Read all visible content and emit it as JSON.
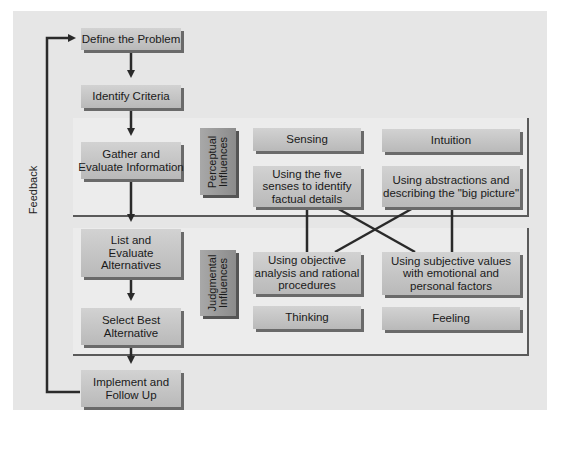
{
  "diagram": {
    "flow_steps": [
      {
        "id": "define",
        "label": "Define the Problem"
      },
      {
        "id": "criteria",
        "label": "Identify Criteria"
      },
      {
        "id": "gather",
        "label": "Gather and\nEvaluate Information"
      },
      {
        "id": "alternatives",
        "label": "List and\nEvaluate\nAlternatives"
      },
      {
        "id": "select",
        "label": "Select Best\nAlternative"
      },
      {
        "id": "implement",
        "label": "Implement and\nFollow Up"
      }
    ],
    "feedback_label": "Feedback",
    "perceptual": {
      "group_label": "Perceptual\nInfluences",
      "sensing": "Sensing",
      "intuition": "Intuition",
      "sensing_desc": "Using the five\nsenses to identify\nfactual details",
      "intuition_desc": "Using abstractions and\ndescribing the \"big picture\""
    },
    "judgmental": {
      "group_label": "Judgmental\nInfluences",
      "thinking_desc": "Using objective\nanalysis and rational\nprocedures",
      "feeling_desc": "Using subjective values\nwith emotional and\npersonal factors",
      "thinking": "Thinking",
      "feeling": "Feeling"
    },
    "colors": {
      "background": "#e6e6e6",
      "box": "#c4c4c4",
      "box_shadow": "#6a6a6a",
      "label_box": "#9a9a9a",
      "line": "#2a2a2a"
    }
  }
}
